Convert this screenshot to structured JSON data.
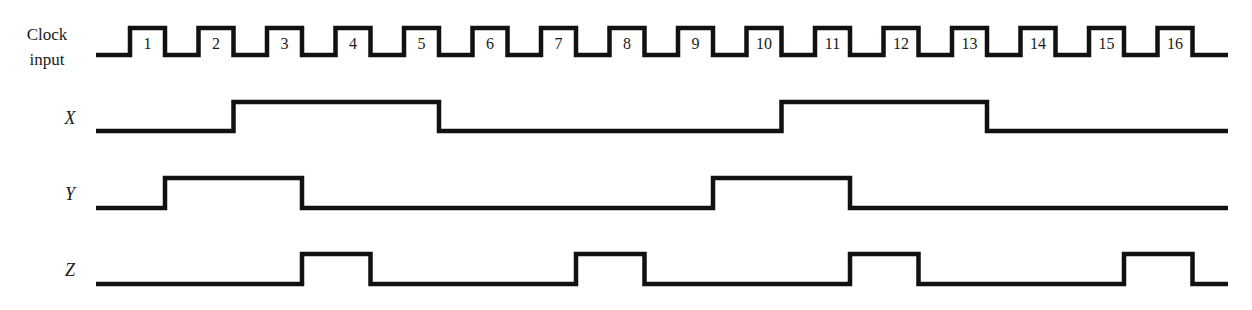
{
  "diagram": {
    "type": "timing-diagram",
    "signals": [
      {
        "name": "Clock input",
        "label_line1": "Clock",
        "label_line2": "input",
        "italic": false
      },
      {
        "name": "X",
        "label": "X",
        "italic": true
      },
      {
        "name": "Y",
        "label": "Y",
        "italic": true
      },
      {
        "name": "Z",
        "label": "Z",
        "italic": true
      }
    ],
    "clock": {
      "pulse_count": 16,
      "pulse_labels": [
        "1",
        "2",
        "3",
        "4",
        "5",
        "6",
        "7",
        "8",
        "9",
        "10",
        "11",
        "12",
        "13",
        "14",
        "15",
        "16"
      ]
    },
    "waveforms": {
      "X": {
        "high_intervals_by_clock_falling_edge": [
          [
            2,
            5
          ],
          [
            10,
            13
          ]
        ]
      },
      "Y": {
        "high_intervals_by_clock_falling_edge": [
          [
            1,
            3
          ],
          [
            9,
            11
          ]
        ]
      },
      "Z": {
        "high_intervals_by_clock_falling_edge": [
          [
            3,
            4
          ],
          [
            7,
            8
          ],
          [
            11,
            12
          ],
          [
            15,
            16
          ]
        ]
      }
    },
    "colors": {
      "line": "#111111",
      "background": "#ffffff"
    }
  },
  "layout": {
    "x_start": 96,
    "x_end": 1228,
    "first_rise": 130,
    "first_fall": 165,
    "period": 68.5,
    "rows": {
      "clock": {
        "high": 28,
        "low": 55
      },
      "X": {
        "high": 102,
        "low": 131
      },
      "Y": {
        "high": 178,
        "low": 208
      },
      "Z": {
        "high": 254,
        "low": 284
      }
    },
    "label_y": {
      "X": 121,
      "Y": 197,
      "Z": 273
    }
  }
}
